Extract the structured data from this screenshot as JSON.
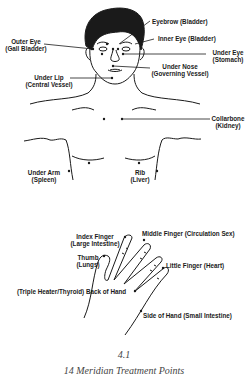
{
  "figure": {
    "number": "4.1",
    "title": "14 Meridian Treatment Points",
    "colors": {
      "line": "#1a1a1a",
      "background": "#ffffff",
      "caption": "#444444"
    }
  },
  "face_points": [
    {
      "id": "eyebrow",
      "line1": "Eyebrow (Bladder)",
      "line2": ""
    },
    {
      "id": "inner-eye",
      "line1": "Inner Eye (Bladder)",
      "line2": ""
    },
    {
      "id": "outer-eye",
      "line1": "Outer Eye",
      "line2": "(Gall Bladder)"
    },
    {
      "id": "under-eye",
      "line1": "Under Eye",
      "line2": "(Stomach)"
    },
    {
      "id": "under-nose",
      "line1": "Under Nose",
      "line2": "(Governing Vessel)"
    },
    {
      "id": "under-lip",
      "line1": "Under Lip",
      "line2": "(Central Vessel)"
    },
    {
      "id": "collarbone",
      "line1": "Collarbone",
      "line2": "(Kidney)"
    }
  ],
  "torso_points": [
    {
      "id": "under-arm",
      "line1": "Under Arm",
      "line2": "(Spleen)"
    },
    {
      "id": "rib",
      "line1": "Rib",
      "line2": "(Liver)"
    }
  ],
  "hand_points": [
    {
      "id": "index-finger",
      "line1": "Index Finger",
      "line2": "(Large Intestine)"
    },
    {
      "id": "middle-finger",
      "line1": "Middle Finger (Circulation Sex)",
      "line2": ""
    },
    {
      "id": "thumb",
      "line1": "Thumb",
      "line2": "(Lungs)"
    },
    {
      "id": "little-finger",
      "line1": "Little Finger (Heart)",
      "line2": ""
    },
    {
      "id": "back-of-hand",
      "line1": "(Triple Heater/Thyroid) Back of Hand",
      "line2": ""
    },
    {
      "id": "side-of-hand",
      "line1": "Side of Hand (Small Intestine)",
      "line2": ""
    }
  ]
}
